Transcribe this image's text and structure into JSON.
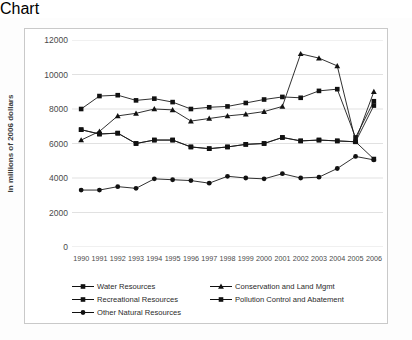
{
  "chart_data": {
    "type": "line",
    "title": "",
    "xlabel": "",
    "ylabel": "In millions of 2006 dollars",
    "ylim": [
      0,
      12000
    ],
    "ytick_values": [
      0,
      2000,
      4000,
      6000,
      8000,
      10000,
      12000
    ],
    "ytick_labels": [
      "0",
      "2000",
      "4000",
      "6000",
      "8000",
      "10000",
      "12000"
    ],
    "grid": true,
    "grid_axis": "y",
    "legend_position": "bottom",
    "categories": [
      "1990",
      "1991",
      "1992",
      "1993",
      "1994",
      "1995",
      "1996",
      "1997",
      "1998",
      "1999",
      "2000",
      "2001",
      "2002",
      "2003",
      "2004",
      "2005",
      "2006"
    ],
    "series": [
      {
        "name": "Water Resources",
        "marker": "square",
        "color": "#1a1a1a",
        "values": [
          8000,
          8750,
          8800,
          8500,
          8600,
          8400,
          8000,
          8100,
          8150,
          8350,
          8550,
          8700,
          8650,
          9050,
          9150,
          6350,
          8450
        ]
      },
      {
        "name": "Conservation and Land Mgmt",
        "marker": "triangle",
        "color": "#1a1a1a",
        "values": [
          6200,
          6700,
          7600,
          7750,
          8000,
          7950,
          7300,
          7450,
          7600,
          7700,
          7850,
          8150,
          11200,
          10950,
          10500,
          6150,
          9000
        ]
      },
      {
        "name": "Recreational Resources",
        "marker": "square",
        "color": "#1a1a1a",
        "values": [
          6800,
          6550,
          6600,
          6000,
          6200,
          6200,
          5800,
          5700,
          5800,
          5950,
          6000,
          6350,
          6150,
          6200,
          6150,
          6100,
          5100
        ]
      },
      {
        "name": "Pollution Control and  Abatement",
        "marker": "square",
        "color": "#1a1a1a",
        "values": [
          6800,
          6550,
          6600,
          6000,
          6200,
          6200,
          5800,
          5700,
          5800,
          5950,
          6000,
          6350,
          6150,
          6200,
          6150,
          6100,
          8200
        ]
      },
      {
        "name": "Other Natural Resources",
        "marker": "circle",
        "color": "#1a1a1a",
        "values": [
          3300,
          3300,
          3500,
          3400,
          3950,
          3900,
          3850,
          3700,
          4100,
          4000,
          3950,
          4250,
          4000,
          4050,
          4550,
          5250,
          5050
        ]
      }
    ],
    "lower_series_note": {
      "recreational_low": [
        2150,
        2300,
        2450,
        2350,
        2600,
        2700,
        2550,
        2600,
        2650,
        2650,
        2800,
        3250,
        3250,
        3250,
        3250,
        3250,
        3250
      ]
    }
  },
  "legend": {
    "items": [
      {
        "label": "Water Resources",
        "marker": "square-marker-icon"
      },
      {
        "label": "Conservation and Land Mgmt",
        "marker": "triangle-marker-icon"
      },
      {
        "label": "Recreational Resources",
        "marker": "square-marker-icon"
      },
      {
        "label": "Pollution Control and  Abatement",
        "marker": "square-marker-icon"
      },
      {
        "label": "Other Natural Resources",
        "marker": "circle-marker-icon"
      }
    ]
  }
}
